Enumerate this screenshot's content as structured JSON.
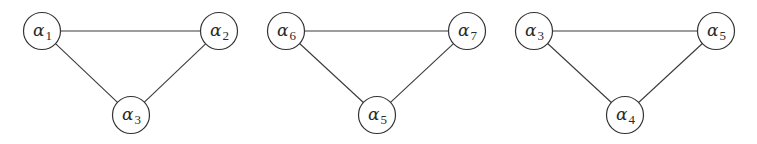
{
  "diagram": {
    "type": "graph",
    "colors": {
      "background": "#ffffff",
      "stroke": "#333333",
      "text": "#2a2a2a"
    },
    "node_radius": 18.5,
    "graphs": [
      {
        "id": "graph-1",
        "nodes": [
          {
            "id": "a1",
            "symbol": "α",
            "subscript": "1",
            "cx": 42,
            "cy": 31
          },
          {
            "id": "a2",
            "symbol": "α",
            "subscript": "2",
            "cx": 219,
            "cy": 31
          },
          {
            "id": "a3",
            "symbol": "α",
            "subscript": "3",
            "cx": 131,
            "cy": 115
          }
        ],
        "edges": [
          [
            "a1",
            "a2"
          ],
          [
            "a1",
            "a3"
          ],
          [
            "a2",
            "a3"
          ]
        ]
      },
      {
        "id": "graph-2",
        "nodes": [
          {
            "id": "a6",
            "symbol": "α",
            "subscript": "6",
            "cx": 286,
            "cy": 31
          },
          {
            "id": "a7",
            "symbol": "α",
            "subscript": "7",
            "cx": 467,
            "cy": 31
          },
          {
            "id": "a5",
            "symbol": "α",
            "subscript": "5",
            "cx": 377,
            "cy": 115
          }
        ],
        "edges": [
          [
            "a6",
            "a7"
          ],
          [
            "a6",
            "a5"
          ],
          [
            "a7",
            "a5"
          ]
        ]
      },
      {
        "id": "graph-3",
        "nodes": [
          {
            "id": "a3",
            "symbol": "α",
            "subscript": "3",
            "cx": 534,
            "cy": 31
          },
          {
            "id": "a5",
            "symbol": "α",
            "subscript": "5",
            "cx": 716,
            "cy": 31
          },
          {
            "id": "a4",
            "symbol": "α",
            "subscript": "4",
            "cx": 625,
            "cy": 115
          }
        ],
        "edges": [
          [
            "a3",
            "a5"
          ],
          [
            "a3",
            "a4"
          ],
          [
            "a5",
            "a4"
          ]
        ]
      }
    ]
  }
}
